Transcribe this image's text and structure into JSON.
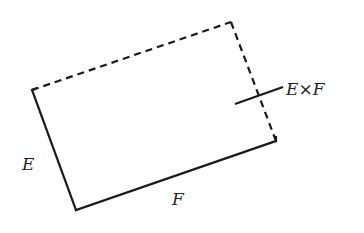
{
  "diagram": {
    "labels": {
      "e": "E",
      "f": "F",
      "cross_product": "E×F"
    },
    "colors": {
      "stroke": "#1a1a1a",
      "text": "#222222",
      "background": "#ffffff"
    },
    "edges": [
      {
        "name": "edge-e",
        "style": "solid",
        "from": [
          32,
          90
        ],
        "to": [
          76,
          210
        ]
      },
      {
        "name": "edge-f",
        "style": "solid",
        "from": [
          76,
          210
        ],
        "to": [
          276,
          141
        ]
      },
      {
        "name": "edge-top",
        "style": "dashed",
        "from": [
          32,
          90
        ],
        "to": [
          231,
          22
        ]
      },
      {
        "name": "edge-right",
        "style": "dashed",
        "from": [
          231,
          22
        ],
        "to": [
          276,
          141
        ]
      }
    ],
    "normal_vector": {
      "from": [
        235,
        104
      ],
      "to": [
        283,
        87
      ]
    }
  }
}
